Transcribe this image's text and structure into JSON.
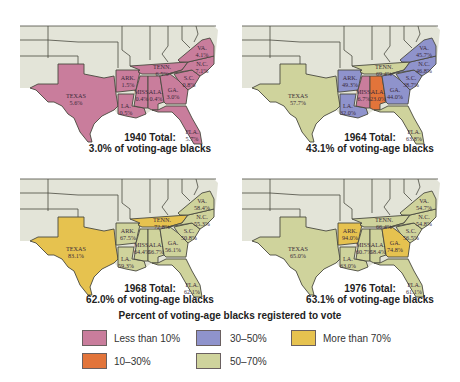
{
  "legend": {
    "title": "Percent of voting-age blacks registered to vote",
    "items": [
      {
        "label": "Less than 10%",
        "color": "#c97d9c"
      },
      {
        "label": "10–30%",
        "color": "#e2743a"
      },
      {
        "label": "30–50%",
        "color": "#8f93cc"
      },
      {
        "label": "50–70%",
        "color": "#cfd39c"
      },
      {
        "label": "More than 70%",
        "color": "#e6c24f"
      }
    ]
  },
  "colors": {
    "land": "#e3e4d8",
    "water": "#ffffff",
    "border": "#4a4a40"
  },
  "maps": [
    {
      "year": "1940",
      "total_line1": "1940 Total:",
      "total_line2": "3.0% of voting-age blacks",
      "states": {
        "TX": {
          "name": "TEXAS",
          "value": "5.6%",
          "fill": "#c97d9c"
        },
        "AR": {
          "name": "ARK.",
          "value": "1.5%",
          "fill": "#c97d9c"
        },
        "LA": {
          "name": "LA.",
          "value": "0.5%",
          "fill": "#c97d9c"
        },
        "MS": {
          "name": "MISS.",
          "value": "0.4%",
          "fill": "#c97d9c"
        },
        "AL": {
          "name": "ALA.",
          "value": "0.4%",
          "fill": "#c97d9c"
        },
        "TN": {
          "name": "TENN.",
          "value": "6.5%",
          "fill": "#c97d9c"
        },
        "GA": {
          "name": "GA.",
          "value": "3.0%",
          "fill": "#c97d9c"
        },
        "SC": {
          "name": "S.C.",
          "value": "0.8%",
          "fill": "#c97d9c"
        },
        "NC": {
          "name": "N.C.",
          "value": "7.1%",
          "fill": "#c97d9c"
        },
        "VA": {
          "name": "VA.",
          "value": "4.1%",
          "fill": "#c97d9c"
        },
        "FL": {
          "name": "FLA.",
          "value": "5.7%",
          "fill": "#c97d9c"
        }
      }
    },
    {
      "year": "1964",
      "total_line1": "1964 Total:",
      "total_line2": "43.1% of voting-age blacks",
      "states": {
        "TX": {
          "name": "TEXAS",
          "value": "57.7%",
          "fill": "#cfd39c"
        },
        "AR": {
          "name": "ARK.",
          "value": "49.3%",
          "fill": "#8f93cc"
        },
        "LA": {
          "name": "LA.",
          "value": "32.0%",
          "fill": "#8f93cc"
        },
        "MS": {
          "name": "MISS.",
          "value": "6.7%",
          "fill": "#c97d9c"
        },
        "AL": {
          "name": "ALA.",
          "value": "23.0%",
          "fill": "#e2743a"
        },
        "TN": {
          "name": "TENN.",
          "value": "69.4%",
          "fill": "#cfd39c"
        },
        "GA": {
          "name": "GA.",
          "value": "44.0%",
          "fill": "#8f93cc"
        },
        "SC": {
          "name": "S.C.",
          "value": "38.7%",
          "fill": "#8f93cc"
        },
        "NC": {
          "name": "N.C.",
          "value": "46.8%",
          "fill": "#8f93cc"
        },
        "VA": {
          "name": "VA.",
          "value": "45.7%",
          "fill": "#8f93cc"
        },
        "FL": {
          "name": "FLA.",
          "value": "63.8%",
          "fill": "#cfd39c"
        }
      }
    },
    {
      "year": "1968",
      "total_line1": "1968 Total:",
      "total_line2": "62.0% of voting-age blacks",
      "states": {
        "TX": {
          "name": "TEXAS",
          "value": "83.1%",
          "fill": "#e6c24f"
        },
        "AR": {
          "name": "ARK.",
          "value": "67.5%",
          "fill": "#cfd39c"
        },
        "LA": {
          "name": "LA.",
          "value": "59.3%",
          "fill": "#cfd39c"
        },
        "MS": {
          "name": "MISS.",
          "value": "64.4%",
          "fill": "#cfd39c"
        },
        "AL": {
          "name": "ALA.",
          "value": "56.7%",
          "fill": "#cfd39c"
        },
        "TN": {
          "name": "TENN.",
          "value": "72.8%",
          "fill": "#e6c24f"
        },
        "GA": {
          "name": "GA.",
          "value": "56.1%",
          "fill": "#cfd39c"
        },
        "SC": {
          "name": "S.C.",
          "value": "50.8%",
          "fill": "#cfd39c"
        },
        "NC": {
          "name": "N.C.",
          "value": "55.3%",
          "fill": "#cfd39c"
        },
        "VA": {
          "name": "VA.",
          "value": "58.4%",
          "fill": "#cfd39c"
        },
        "FL": {
          "name": "FLA.",
          "value": "62.1%",
          "fill": "#cfd39c"
        }
      }
    },
    {
      "year": "1976",
      "total_line1": "1976 Total:",
      "total_line2": "63.1% of voting-age blacks",
      "states": {
        "TX": {
          "name": "TEXAS",
          "value": "65.0%",
          "fill": "#cfd39c"
        },
        "AR": {
          "name": "ARK.",
          "value": "94.0%",
          "fill": "#e6c24f"
        },
        "LA": {
          "name": "LA.",
          "value": "63.0%",
          "fill": "#cfd39c"
        },
        "MS": {
          "name": "MISS.",
          "value": "60.7%",
          "fill": "#cfd39c"
        },
        "AL": {
          "name": "ALA.",
          "value": "58.4%",
          "fill": "#cfd39c"
        },
        "TN": {
          "name": "TENN.",
          "value": "66.4%",
          "fill": "#cfd39c"
        },
        "GA": {
          "name": "GA.",
          "value": "74.8%",
          "fill": "#e6c24f"
        },
        "SC": {
          "name": "S.C.",
          "value": "56.5%",
          "fill": "#cfd39c"
        },
        "NC": {
          "name": "N.C.",
          "value": "54.8%",
          "fill": "#cfd39c"
        },
        "VA": {
          "name": "VA.",
          "value": "54.7%",
          "fill": "#cfd39c"
        },
        "FL": {
          "name": "FLA.",
          "value": "61.1%",
          "fill": "#cfd39c"
        }
      }
    }
  ]
}
